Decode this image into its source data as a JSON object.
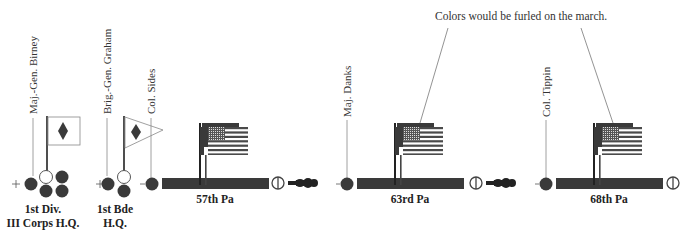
{
  "diagram": {
    "note": "Colors would be furled on the march.",
    "colors": {
      "dark": "#3a3a3a",
      "line": "#888888",
      "flag_red": "#4a4a4a",
      "white": "#ffffff"
    },
    "commanders": [
      {
        "label": "Maj.-Gen. Birney",
        "x": 33
      },
      {
        "label": "Brig.-Gen. Graham",
        "x": 107
      },
      {
        "label": "Col. Sides",
        "x": 151
      },
      {
        "label": "Maj. Danks",
        "x": 347
      },
      {
        "label": "Col. Tippin",
        "x": 546
      }
    ],
    "headquarters": [
      {
        "label_line1": "1st Div.",
        "label_line2": "III Corps H.Q."
      },
      {
        "label_line1": "1st Bde",
        "label_line2": "H.Q."
      }
    ],
    "regiments": [
      {
        "name": "57th Pa",
        "has_gun": true
      },
      {
        "name": "63rd Pa",
        "has_gun": true
      },
      {
        "name": "68th Pa",
        "has_gun": false
      }
    ],
    "legend_icons": [
      "division-flag-diamond",
      "brigade-pennant-diamond",
      "us-flag",
      "officer-circle",
      "gun-limber"
    ]
  }
}
